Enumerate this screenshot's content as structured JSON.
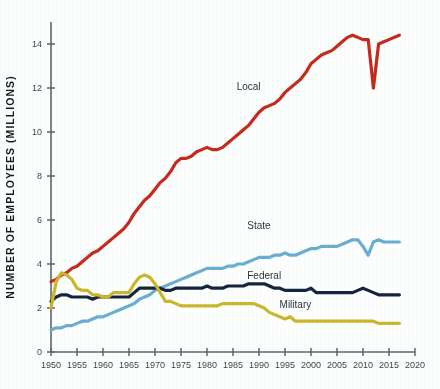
{
  "chart_data": {
    "type": "line",
    "title": "",
    "xlabel": "",
    "ylabel": "NUMBER OF EMPLOYEES (MILLIONS)",
    "xlim": [
      1950,
      2020
    ],
    "ylim": [
      0,
      15
    ],
    "grid": false,
    "legend_position": "inline-labels",
    "xticks": [
      1950,
      1955,
      1960,
      1965,
      1970,
      1975,
      1980,
      1985,
      1990,
      1995,
      2000,
      2005,
      2010,
      2015,
      2020
    ],
    "yticks": [
      0,
      2,
      4,
      6,
      8,
      10,
      12,
      14
    ],
    "series": [
      {
        "name": "Local",
        "color": "#c52a1c",
        "label_x": 1988,
        "label_y": 11.9,
        "x": [
          1950,
          1951,
          1952,
          1953,
          1954,
          1955,
          1956,
          1957,
          1958,
          1959,
          1960,
          1961,
          1962,
          1963,
          1964,
          1965,
          1966,
          1967,
          1968,
          1969,
          1970,
          1971,
          1972,
          1973,
          1974,
          1975,
          1976,
          1977,
          1978,
          1979,
          1980,
          1981,
          1982,
          1983,
          1984,
          1985,
          1986,
          1987,
          1988,
          1989,
          1990,
          1991,
          1992,
          1993,
          1994,
          1995,
          1996,
          1997,
          1998,
          1999,
          2000,
          2001,
          2002,
          2003,
          2004,
          2005,
          2006,
          2007,
          2008,
          2009,
          2010,
          2011,
          2012,
          2013,
          2014,
          2015,
          2016,
          2017
        ],
        "values": [
          3.2,
          3.3,
          3.5,
          3.6,
          3.8,
          3.9,
          4.1,
          4.3,
          4.5,
          4.6,
          4.8,
          5.0,
          5.2,
          5.4,
          5.6,
          5.9,
          6.3,
          6.6,
          6.9,
          7.1,
          7.4,
          7.7,
          7.9,
          8.2,
          8.6,
          8.8,
          8.8,
          8.9,
          9.1,
          9.2,
          9.3,
          9.2,
          9.2,
          9.3,
          9.5,
          9.7,
          9.9,
          10.1,
          10.3,
          10.6,
          10.9,
          11.1,
          11.2,
          11.3,
          11.5,
          11.8,
          12.0,
          12.2,
          12.4,
          12.7,
          13.1,
          13.3,
          13.5,
          13.6,
          13.7,
          13.9,
          14.1,
          14.3,
          14.4,
          14.3,
          14.2,
          14.2,
          12.0,
          14.0,
          14.1,
          14.2,
          14.3,
          14.4
        ]
      },
      {
        "name": "State",
        "color": "#6aaed0",
        "label_x": 1990,
        "label_y": 5.6,
        "x": [
          1950,
          1951,
          1952,
          1953,
          1954,
          1955,
          1956,
          1957,
          1958,
          1959,
          1960,
          1961,
          1962,
          1963,
          1964,
          1965,
          1966,
          1967,
          1968,
          1969,
          1970,
          1971,
          1972,
          1973,
          1974,
          1975,
          1976,
          1977,
          1978,
          1979,
          1980,
          1981,
          1982,
          1983,
          1984,
          1985,
          1986,
          1987,
          1988,
          1989,
          1990,
          1991,
          1992,
          1993,
          1994,
          1995,
          1996,
          1997,
          1998,
          1999,
          2000,
          2001,
          2002,
          2003,
          2004,
          2005,
          2006,
          2007,
          2008,
          2009,
          2010,
          2011,
          2012,
          2013,
          2014,
          2015,
          2016,
          2017
        ],
        "values": [
          1.0,
          1.1,
          1.1,
          1.2,
          1.2,
          1.3,
          1.4,
          1.4,
          1.5,
          1.6,
          1.6,
          1.7,
          1.8,
          1.9,
          2.0,
          2.1,
          2.2,
          2.4,
          2.5,
          2.6,
          2.8,
          2.9,
          3.0,
          3.1,
          3.2,
          3.3,
          3.4,
          3.5,
          3.6,
          3.7,
          3.8,
          3.8,
          3.8,
          3.8,
          3.9,
          3.9,
          4.0,
          4.0,
          4.1,
          4.2,
          4.3,
          4.3,
          4.3,
          4.4,
          4.4,
          4.5,
          4.4,
          4.4,
          4.5,
          4.6,
          4.7,
          4.7,
          4.8,
          4.8,
          4.8,
          4.8,
          4.9,
          5.0,
          5.1,
          5.1,
          4.8,
          4.4,
          5.0,
          5.1,
          5.0,
          5.0,
          5.0,
          5.0
        ]
      },
      {
        "name": "Federal",
        "color": "#16253f",
        "label_x": 1991,
        "label_y": 3.3,
        "x": [
          1950,
          1951,
          1952,
          1953,
          1954,
          1955,
          1956,
          1957,
          1958,
          1959,
          1960,
          1961,
          1962,
          1963,
          1964,
          1965,
          1966,
          1967,
          1968,
          1969,
          1970,
          1971,
          1972,
          1973,
          1974,
          1975,
          1976,
          1977,
          1978,
          1979,
          1980,
          1981,
          1982,
          1983,
          1984,
          1985,
          1986,
          1987,
          1988,
          1989,
          1990,
          1991,
          1992,
          1993,
          1994,
          1995,
          1996,
          1997,
          1998,
          1999,
          2000,
          2001,
          2002,
          2003,
          2004,
          2005,
          2006,
          2007,
          2008,
          2009,
          2010,
          2011,
          2012,
          2013,
          2014,
          2015,
          2016,
          2017
        ],
        "values": [
          2.3,
          2.5,
          2.6,
          2.6,
          2.5,
          2.5,
          2.5,
          2.5,
          2.4,
          2.5,
          2.5,
          2.5,
          2.5,
          2.5,
          2.5,
          2.5,
          2.7,
          2.9,
          2.9,
          2.9,
          2.9,
          2.9,
          2.8,
          2.8,
          2.9,
          2.9,
          2.9,
          2.9,
          2.9,
          2.9,
          3.0,
          2.9,
          2.9,
          2.9,
          3.0,
          3.0,
          3.0,
          3.0,
          3.1,
          3.1,
          3.1,
          3.1,
          3.0,
          2.9,
          2.9,
          2.8,
          2.8,
          2.8,
          2.8,
          2.8,
          2.9,
          2.7,
          2.7,
          2.7,
          2.7,
          2.7,
          2.7,
          2.7,
          2.7,
          2.8,
          2.9,
          2.8,
          2.7,
          2.6,
          2.6,
          2.6,
          2.6,
          2.6
        ]
      },
      {
        "name": "Military",
        "color": "#c9b72c",
        "label_x": 1997,
        "label_y": 2.0,
        "x": [
          1950,
          1951,
          1952,
          1953,
          1954,
          1955,
          1956,
          1957,
          1958,
          1959,
          1960,
          1961,
          1962,
          1963,
          1964,
          1965,
          1966,
          1967,
          1968,
          1969,
          1970,
          1971,
          1972,
          1973,
          1974,
          1975,
          1976,
          1977,
          1978,
          1979,
          1980,
          1981,
          1982,
          1983,
          1984,
          1985,
          1986,
          1987,
          1988,
          1989,
          1990,
          1991,
          1992,
          1993,
          1994,
          1995,
          1996,
          1997,
          1998,
          1999,
          2000,
          2001,
          2002,
          2003,
          2004,
          2005,
          2006,
          2007,
          2008,
          2009,
          2010,
          2011,
          2012,
          2013,
          2014,
          2015,
          2016,
          2017
        ],
        "values": [
          2.0,
          3.2,
          3.6,
          3.5,
          3.3,
          2.9,
          2.8,
          2.8,
          2.6,
          2.6,
          2.5,
          2.5,
          2.7,
          2.7,
          2.7,
          2.7,
          3.1,
          3.4,
          3.5,
          3.4,
          3.1,
          2.7,
          2.3,
          2.3,
          2.2,
          2.1,
          2.1,
          2.1,
          2.1,
          2.1,
          2.1,
          2.1,
          2.1,
          2.2,
          2.2,
          2.2,
          2.2,
          2.2,
          2.2,
          2.2,
          2.1,
          2.0,
          1.8,
          1.7,
          1.6,
          1.5,
          1.6,
          1.4,
          1.4,
          1.4,
          1.4,
          1.4,
          1.4,
          1.4,
          1.4,
          1.4,
          1.4,
          1.4,
          1.4,
          1.4,
          1.4,
          1.4,
          1.4,
          1.3,
          1.3,
          1.3,
          1.3,
          1.3
        ]
      }
    ]
  },
  "axis": {
    "y_title": "NUMBER OF EMPLOYEES (MILLIONS)"
  }
}
